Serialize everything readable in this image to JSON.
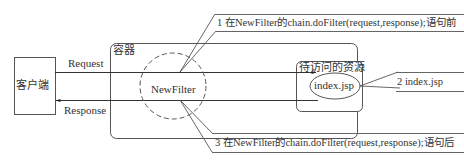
{
  "diagram": {
    "client": {
      "label": "客户端"
    },
    "container": {
      "label": "容器"
    },
    "resource_box": {
      "label": "待访问的资源"
    },
    "filter": {
      "label": "NewFilter"
    },
    "resource": {
      "label": "index.jsp"
    },
    "request": {
      "label": "Request"
    },
    "response": {
      "label": "Response"
    },
    "callouts": [
      {
        "label": "1 在NewFilter的chain.doFilter(request,response);语句前"
      },
      {
        "label": "2 index.jsp"
      },
      {
        "label": "3 在NewFilter的chain.doFilter(request,response);语句后"
      }
    ],
    "colors": {
      "stroke": "#3a3a3a",
      "text": "#333333",
      "background": "#ffffff"
    }
  }
}
